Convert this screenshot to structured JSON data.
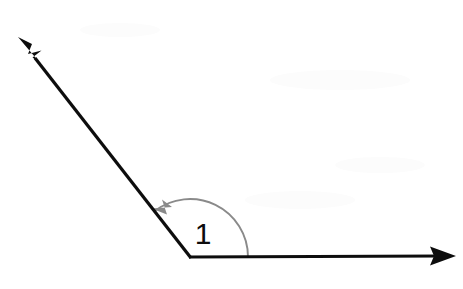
{
  "figure": {
    "background_color": "#ffffff",
    "width": 463,
    "height": 289
  },
  "geometry": {
    "vertex": {
      "label": "vertex",
      "x": 190,
      "y": 257
    },
    "rays": [
      {
        "name": "horizontal-ray",
        "direction": "right",
        "from": {
          "x": 190,
          "y": 257
        },
        "to": {
          "x": 456,
          "y": 256
        },
        "color": "#0d0d0d",
        "thickness": 3.2,
        "arrowhead": "end"
      },
      {
        "name": "diagonal-ray",
        "direction": "upper-left",
        "from": {
          "x": 190,
          "y": 257
        },
        "to": {
          "x": 19,
          "y": 38
        },
        "color": "#0d0d0d",
        "thickness": 3.2,
        "arrowhead": "end"
      }
    ],
    "angle_arc": {
      "name": "angle-arc",
      "center": {
        "x": 190,
        "y": 257
      },
      "radius": 58,
      "start_angle_deg": 0,
      "end_angle_deg": 128,
      "sweep": "counterclockwise",
      "color": "#8a8a8a",
      "thickness": 1.9,
      "arrowhead": "end"
    }
  },
  "labels": {
    "angle_label": {
      "name": "angle-label",
      "text": "1",
      "x": 203,
      "y": 244,
      "font_size": 30,
      "color": "#0d0d0d"
    }
  },
  "measurements": {
    "angle_degrees": 128,
    "angle_type": "obtuse"
  },
  "colors": {
    "ink": "#0d0d0d",
    "arc": "#8a8a8a",
    "paper": "#ffffff",
    "smudge": "#fcfcfc"
  }
}
